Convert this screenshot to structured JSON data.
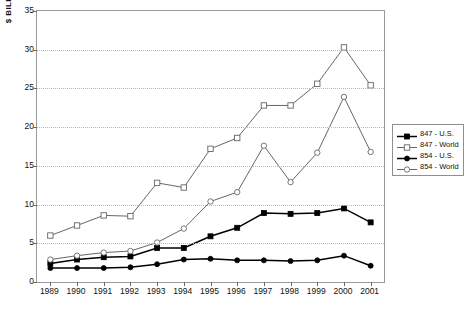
{
  "chart_data": {
    "type": "line",
    "title": "",
    "xlabel": "",
    "ylabel": "$ BILL.",
    "ylim": [
      0,
      35
    ],
    "ytick_step": 5,
    "yticks": [
      "0",
      "5",
      "10",
      "15",
      "20",
      "25",
      "30",
      "35"
    ],
    "grid": true,
    "legend_position": "right",
    "categories": [
      "1989",
      "1990",
      "1991",
      "1992",
      "1993",
      "1994",
      "1995",
      "1996",
      "1997",
      "1998",
      "1999",
      "2000",
      "2001"
    ],
    "series": [
      {
        "name": "847 - U.S.",
        "marker": "filled-square",
        "color": "#000000",
        "values": [
          2.4,
          2.9,
          3.2,
          3.3,
          4.4,
          4.4,
          5.9,
          7.0,
          8.9,
          8.8,
          8.9,
          9.5,
          7.7
        ]
      },
      {
        "name": "847 - World",
        "marker": "open-square",
        "color": "#555555",
        "values": [
          6.0,
          7.3,
          8.6,
          8.5,
          12.8,
          12.2,
          17.2,
          18.6,
          22.8,
          22.8,
          25.6,
          30.3,
          25.4
        ]
      },
      {
        "name": "854 - U.S.",
        "marker": "filled-circle",
        "color": "#000000",
        "values": [
          1.8,
          1.8,
          1.8,
          1.9,
          2.3,
          2.9,
          3.0,
          2.8,
          2.8,
          2.7,
          2.8,
          3.4,
          2.1
        ]
      },
      {
        "name": "854 - World",
        "marker": "open-circle",
        "color": "#555555",
        "values": [
          2.9,
          3.4,
          3.8,
          4.0,
          5.1,
          6.9,
          10.4,
          11.6,
          17.6,
          12.9,
          16.7,
          23.9,
          16.8
        ]
      }
    ]
  },
  "legend": {
    "entries": [
      {
        "label": "847 - U.S."
      },
      {
        "label": "847 - World"
      },
      {
        "label": "854 - U.S."
      },
      {
        "label": "854 - World"
      }
    ]
  }
}
